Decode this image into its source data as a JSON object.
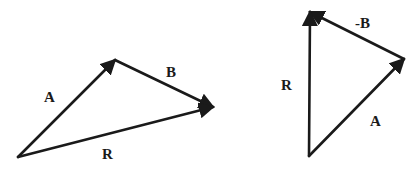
{
  "figure": {
    "width": 410,
    "height": 195,
    "background": "#ffffff",
    "ink_color": "#1a1a1a"
  },
  "diagrams": [
    {
      "name": "vector-addition",
      "description": "A + B = R (head-to-tail)",
      "points": {
        "origin": [
          18,
          157
        ],
        "a_tip": [
          115,
          60
        ],
        "b_tip": [
          213,
          107
        ]
      },
      "vectors": [
        {
          "label": "A",
          "from": "origin",
          "to": "a_tip",
          "label_pos": [
            50,
            102
          ]
        },
        {
          "label": "B",
          "from": "a_tip",
          "to": "b_tip",
          "label_pos": [
            172,
            77
          ]
        },
        {
          "label": "R",
          "from": "origin",
          "to": "b_tip",
          "label_pos": [
            108,
            158
          ]
        }
      ]
    },
    {
      "name": "vector-subtraction",
      "description": "A + (-B) = R (head-to-tail)",
      "points": {
        "origin": [
          309,
          156
        ],
        "a_tip": [
          404,
          59
        ],
        "r_tip": [
          310,
          12
        ]
      },
      "vectors": [
        {
          "label": "A",
          "from": "origin",
          "to": "a_tip",
          "label_pos": [
            376,
            126
          ]
        },
        {
          "label": "-B",
          "from": "a_tip",
          "to": "r_tip",
          "label_pos": [
            364,
            28
          ]
        },
        {
          "label": "R",
          "from": "origin",
          "to": "r_tip",
          "label_pos": [
            287,
            89
          ]
        }
      ]
    }
  ],
  "labels": {
    "left_a": "A",
    "left_b": "B",
    "left_r": "R",
    "right_neg_b": "-B",
    "right_r": "R",
    "right_a": "A"
  }
}
